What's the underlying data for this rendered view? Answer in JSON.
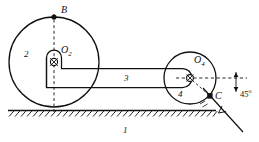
{
  "figure": {
    "type": "mechanism-kinematic-diagram",
    "background_color": "#ffffff",
    "line_color": "#111111",
    "labels": {
      "ground": "1",
      "wheel_left": "2",
      "link": "3",
      "wheel_right": "4",
      "point_b": "B",
      "point_c": "C",
      "pivot_o2_base": "O",
      "pivot_o2_sub": "2",
      "pivot_o4_base": "O",
      "pivot_o4_sub": "4",
      "angle": "45",
      "angle_unit": "o"
    }
  },
  "geometry": {
    "wheel_left": {
      "cx": 54,
      "cy": 62,
      "r": 45
    },
    "wheel_right": {
      "cx": 190,
      "cy": 78,
      "r": 26
    },
    "pivot_o2": {
      "x": 54,
      "y": 62
    },
    "pivot_o4": {
      "x": 190,
      "y": 78
    },
    "point_b": {
      "x": 54,
      "y": 17
    },
    "point_c": {
      "x": 210,
      "y": 96
    },
    "ground_line": {
      "x1": 8,
      "y1": 110,
      "x2": 216,
      "y2": 110
    },
    "incline_angle_deg": 45
  }
}
